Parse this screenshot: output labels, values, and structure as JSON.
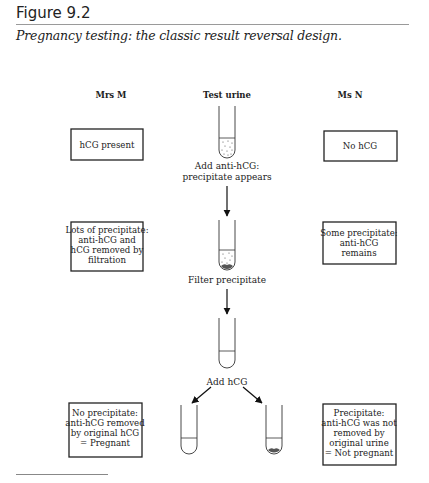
{
  "figure": {
    "title": "Figure 9.2",
    "caption": "Pregnancy testing: the classic result reversal design."
  },
  "columns": {
    "left": "Mrs M",
    "center": "Test urine",
    "right": "Ms N"
  },
  "steps": {
    "step1": {
      "line1": "Add anti-hCG:",
      "line2": "precipitate appears"
    },
    "step2": "Filter precipitate",
    "step3": "Add hCG"
  },
  "boxes": {
    "mrs_m_1": [
      "hCG present"
    ],
    "ms_n_1": [
      "No hCG"
    ],
    "mrs_m_2": [
      "Lots of precipitate:",
      "anti-hCG and",
      "hCG removed by",
      "filtration"
    ],
    "ms_n_2": [
      "Some precipitate:",
      "anti-hCG",
      "remains"
    ],
    "mrs_m_3": [
      "No precipitate:",
      "anti-hCG removed",
      "by original hCG",
      "= Pregnant"
    ],
    "ms_n_3": [
      "Precipitate:",
      "anti-hCG was not",
      "removed by",
      "original urine",
      "= Not pregnant"
    ]
  },
  "tubes": [
    {
      "id": "tube-1",
      "contents": "dotted-liquid"
    },
    {
      "id": "tube-2",
      "contents": "dotted-liquid-with-sediment"
    },
    {
      "id": "tube-3",
      "contents": "clear-liquid"
    },
    {
      "id": "tube-4",
      "contents": "clear-liquid"
    },
    {
      "id": "tube-5",
      "contents": "clear-liquid-with-sediment"
    }
  ]
}
